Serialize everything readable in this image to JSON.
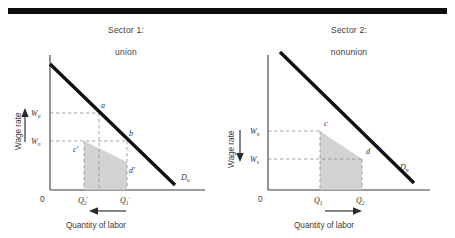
{
  "figure": {
    "top_rule": true,
    "panels": [
      {
        "id": "sector-1",
        "title_line1": "Sector 1:",
        "title_line2": "union",
        "y_axis_label": "Wage rate",
        "x_axis_label": "Quantity of labor",
        "origin_label": "0",
        "demand_label": "D",
        "demand_sub": "u",
        "wage_high": {
          "label": "W",
          "sub": "u"
        },
        "wage_low": {
          "label": "W",
          "sub": "n"
        },
        "quantity_left": {
          "label": "Q",
          "sub": "2",
          "prime": "′"
        },
        "quantity_right": {
          "label": "Q",
          "sub": "1",
          "prime": "′"
        },
        "points": [
          "a",
          "b",
          "c′",
          "d′"
        ],
        "wage_arrow_direction": "up",
        "quantity_arrow_direction": "left"
      },
      {
        "id": "sector-2",
        "title_line1": "Sector 2:",
        "title_line2": "nonunion",
        "y_axis_label": "Wage rate",
        "x_axis_label": "Quantity of labor",
        "origin_label": "0",
        "demand_label": "D",
        "demand_sub": "n",
        "wage_high": {
          "label": "W",
          "sub": "n"
        },
        "wage_low": {
          "label": "W",
          "sub": "s"
        },
        "quantity_left": {
          "label": "Q",
          "sub": "1",
          "prime": ""
        },
        "quantity_right": {
          "label": "Q",
          "sub": "2",
          "prime": ""
        },
        "points": [
          "c",
          "d"
        ],
        "wage_arrow_direction": "down",
        "quantity_arrow_direction": "right"
      }
    ],
    "colors": {
      "rule": "#0d0d0d",
      "demand_curve": "#111111",
      "shaded_area": "#c9c9c9",
      "dashed_guide": "#8e8e8e",
      "axis": "#3a3a3a",
      "text": "#2f2f2f"
    }
  }
}
